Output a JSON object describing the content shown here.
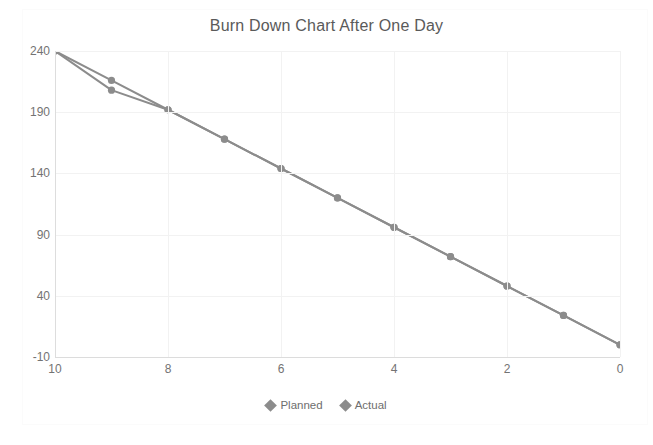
{
  "chart_data": {
    "type": "line",
    "title": "Burn Down Chart After One Day",
    "xlabel": "",
    "ylabel": "",
    "x": [
      10,
      9,
      8,
      7,
      6,
      5,
      4,
      3,
      2,
      1,
      0
    ],
    "xlim": [
      10,
      0
    ],
    "ylim": [
      -10,
      240
    ],
    "x_reversed": true,
    "xticks": [
      10,
      8,
      6,
      4,
      2,
      0
    ],
    "xtick_labels": [
      "10",
      "8",
      "6",
      "4",
      "2",
      "0"
    ],
    "yticks": [
      240,
      190,
      140,
      90,
      40,
      -10
    ],
    "ytick_labels": [
      "240",
      "190",
      "140",
      "90",
      "40",
      "-10"
    ],
    "grid": true,
    "legend_position": "bottom",
    "series": [
      {
        "name": "Planned",
        "color": "#8c8c8c",
        "marker": "circle",
        "values": [
          240,
          216,
          192,
          168,
          144,
          120,
          96,
          72,
          48,
          24,
          0
        ]
      },
      {
        "name": "Actual",
        "color": "#8c8c8c",
        "marker": "circle",
        "values": [
          240,
          208,
          192,
          168,
          144,
          120,
          96,
          72,
          48,
          24,
          0
        ]
      }
    ]
  },
  "legend": {
    "items": [
      {
        "label": "Planned",
        "color": "#8c8c8c"
      },
      {
        "label": "Actual",
        "color": "#8c8c8c"
      }
    ]
  },
  "colors": {
    "line": "#8c8c8c",
    "grid": "#f2f2f2",
    "axis": "#dcdcdc",
    "tick_text": "#737373",
    "title_text": "#5a5a5a",
    "background": "#ffffff"
  }
}
